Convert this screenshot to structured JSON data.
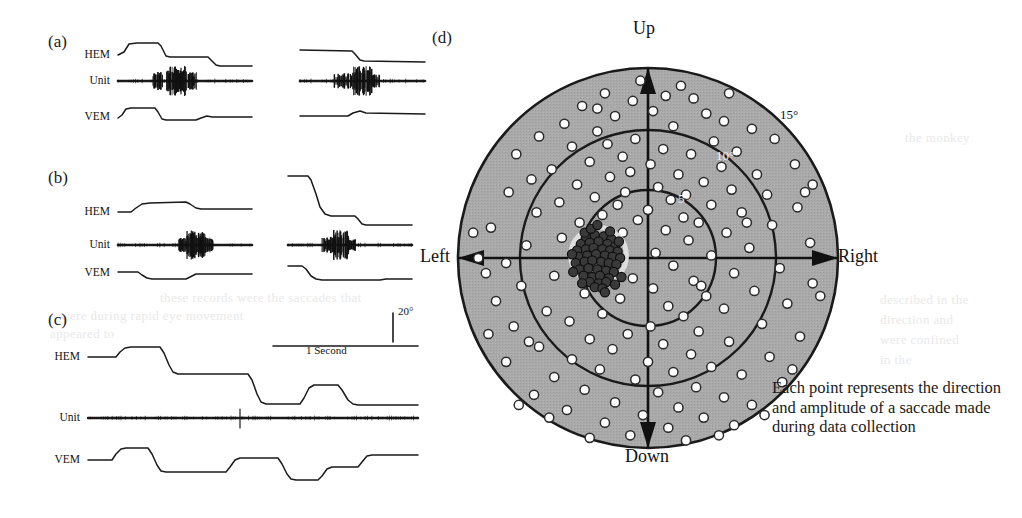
{
  "figure": {
    "panels": [
      {
        "id": "a",
        "letter": "(a)"
      },
      {
        "id": "b",
        "letter": "(b)"
      },
      {
        "id": "c",
        "letter": "(c)"
      },
      {
        "id": "d",
        "letter": "(d)"
      }
    ],
    "trace_labels": [
      "HEM",
      "Unit",
      "VEM"
    ],
    "scalebars": {
      "amplitude": "20°",
      "time": "1 Second"
    },
    "caption": "Each point represents the direction and amplitude of a saccade made during data collection",
    "axes": {
      "up": "Up",
      "down": "Down",
      "left": "Left",
      "right": "Right"
    },
    "rings": [
      {
        "label": "15°",
        "deg": 15,
        "style": "outer"
      },
      {
        "label": "10°",
        "deg": 10,
        "style": "inner"
      },
      {
        "label": "5°",
        "deg": 5,
        "style": "inner"
      }
    ],
    "colors": {
      "disk_fill": "#a9a9a9",
      "stroke": "#1a1a1a",
      "open_point_fill": "#ffffff",
      "dense_point_fill": "#3a3a3a",
      "cluster_ring": "#dedede",
      "page": "#ffffff"
    }
  },
  "chart_data": {
    "type": "scatter",
    "coordinate_system": "polar-cartesian (degrees of visual angle)",
    "title": "",
    "xlabel": "Horizontal eye position (deg)",
    "ylabel": "Vertical eye position (deg)",
    "xlim": [
      -15,
      15
    ],
    "ylim": [
      -15,
      15
    ],
    "grid": "concentric circles at 5, 10 and 15 degrees",
    "legend": "none",
    "ring_radii_deg": [
      5,
      10,
      15
    ],
    "series": [
      {
        "name": "saccades-open",
        "marker": "open circle",
        "points": [
          [
            -0.6,
            14.0
          ],
          [
            2.6,
            13.6
          ],
          [
            -3.4,
            13.0
          ],
          [
            1.4,
            12.8
          ],
          [
            -1.2,
            12.4
          ],
          [
            3.6,
            12.6
          ],
          [
            -5.2,
            12.0
          ],
          [
            0.4,
            11.6
          ],
          [
            4.6,
            11.4
          ],
          [
            -2.6,
            11.2
          ],
          [
            6.0,
            10.8
          ],
          [
            -6.6,
            10.6
          ],
          [
            2.0,
            10.4
          ],
          [
            -4.0,
            10.0
          ],
          [
            8.2,
            10.2
          ],
          [
            -8.6,
            9.6
          ],
          [
            -1.0,
            9.4
          ],
          [
            5.2,
            9.2
          ],
          [
            -3.2,
            9.0
          ],
          [
            10.0,
            9.4
          ],
          [
            -6.0,
            8.8
          ],
          [
            1.2,
            8.6
          ],
          [
            7.0,
            8.4
          ],
          [
            -10.4,
            8.2
          ],
          [
            -2.0,
            8.0
          ],
          [
            3.4,
            8.2
          ],
          [
            -4.6,
            7.6
          ],
          [
            11.6,
            7.4
          ],
          [
            0.2,
            7.4
          ],
          [
            5.8,
            7.2
          ],
          [
            -7.6,
            7.0
          ],
          [
            -1.4,
            6.8
          ],
          [
            8.6,
            6.6
          ],
          [
            2.4,
            6.6
          ],
          [
            -3.0,
            6.4
          ],
          [
            -9.2,
            6.2
          ],
          [
            4.4,
            6.0
          ],
          [
            13.0,
            5.8
          ],
          [
            -5.6,
            5.8
          ],
          [
            0.8,
            5.6
          ],
          [
            6.6,
            5.4
          ],
          [
            -1.8,
            5.2
          ],
          [
            -11.0,
            5.2
          ],
          [
            3.0,
            5.0
          ],
          [
            9.4,
            5.0
          ],
          [
            -4.2,
            4.8
          ],
          [
            1.8,
            4.6
          ],
          [
            -7.0,
            4.4
          ],
          [
            5.0,
            4.2
          ],
          [
            -2.4,
            4.2
          ],
          [
            11.8,
            4.0
          ],
          [
            0.0,
            3.8
          ],
          [
            7.4,
            3.6
          ],
          [
            -8.8,
            3.6
          ],
          [
            -3.6,
            3.4
          ],
          [
            2.8,
            3.2
          ],
          [
            -0.8,
            3.0
          ],
          [
            4.0,
            2.8
          ],
          [
            -5.4,
            2.8
          ],
          [
            9.8,
            2.6
          ],
          [
            -12.4,
            2.4
          ],
          [
            1.4,
            2.2
          ],
          [
            6.2,
            2.0
          ],
          [
            -2.0,
            2.0
          ],
          [
            -6.8,
            1.6
          ],
          [
            3.2,
            1.4
          ],
          [
            12.8,
            1.2
          ],
          [
            -9.6,
            1.0
          ],
          [
            8.0,
            0.8
          ],
          [
            -3.0,
            0.6
          ],
          [
            0.6,
            0.4
          ],
          [
            5.0,
            0.2
          ],
          [
            -13.4,
            0.0
          ],
          [
            -11.2,
            -0.4
          ],
          [
            2.0,
            -0.6
          ],
          [
            10.4,
            -0.8
          ],
          [
            -4.4,
            -1.0
          ],
          [
            6.8,
            -1.2
          ],
          [
            -7.4,
            -1.4
          ],
          [
            -1.2,
            -1.6
          ],
          [
            3.6,
            -1.8
          ],
          [
            13.0,
            -2.0
          ],
          [
            -10.0,
            -2.2
          ],
          [
            0.4,
            -2.4
          ],
          [
            8.4,
            -2.6
          ],
          [
            -5.0,
            -2.8
          ],
          [
            4.6,
            -3.0
          ],
          [
            -2.2,
            -3.2
          ],
          [
            -12.0,
            -3.4
          ],
          [
            11.0,
            -3.6
          ],
          [
            1.6,
            -3.8
          ],
          [
            6.0,
            -4.0
          ],
          [
            -8.0,
            -4.2
          ],
          [
            -3.6,
            -4.4
          ],
          [
            2.8,
            -4.6
          ],
          [
            -6.2,
            -5.0
          ],
          [
            9.0,
            -5.2
          ],
          [
            0.2,
            -5.4
          ],
          [
            -10.6,
            -5.4
          ],
          [
            4.0,
            -5.8
          ],
          [
            -1.6,
            -6.0
          ],
          [
            12.0,
            -6.2
          ],
          [
            -4.6,
            -6.4
          ],
          [
            6.4,
            -6.6
          ],
          [
            1.2,
            -6.8
          ],
          [
            -8.6,
            -7.0
          ],
          [
            -2.8,
            -7.2
          ],
          [
            3.4,
            -7.6
          ],
          [
            9.6,
            -7.8
          ],
          [
            -6.0,
            -8.0
          ],
          [
            0.0,
            -8.2
          ],
          [
            -11.2,
            -8.2
          ],
          [
            5.0,
            -8.6
          ],
          [
            -3.8,
            -8.8
          ],
          [
            2.0,
            -9.0
          ],
          [
            7.4,
            -9.2
          ],
          [
            -7.4,
            -9.4
          ],
          [
            -1.0,
            -9.6
          ],
          [
            10.6,
            -9.8
          ],
          [
            3.8,
            -10.2
          ],
          [
            -5.0,
            -10.4
          ],
          [
            0.8,
            -10.6
          ],
          [
            -9.0,
            -10.8
          ],
          [
            6.0,
            -11.0
          ],
          [
            -2.6,
            -11.4
          ],
          [
            2.4,
            -11.8
          ],
          [
            8.2,
            -11.6
          ],
          [
            -6.4,
            -12.0
          ],
          [
            -0.4,
            -12.4
          ],
          [
            4.4,
            -12.6
          ],
          [
            -3.4,
            -13.0
          ],
          [
            1.6,
            -13.4
          ],
          [
            6.8,
            -13.2
          ],
          [
            -1.4,
            -14.0
          ],
          [
            -4.6,
            -14.2
          ],
          [
            3.0,
            -14.4
          ],
          [
            -7.8,
            -12.6
          ],
          [
            11.4,
            -8.8
          ],
          [
            -12.6,
            -6.0
          ],
          [
            13.6,
            -3.0
          ],
          [
            -13.8,
            2.0
          ],
          [
            12.4,
            5.2
          ],
          [
            -12.8,
            -1.2
          ],
          [
            9.2,
            -12.4
          ],
          [
            -10.2,
            -11.6
          ],
          [
            5.6,
            -14.0
          ],
          [
            -5.8,
            0.4
          ],
          [
            7.8,
            2.8
          ],
          [
            -9.4,
            -6.6
          ],
          [
            4.2,
            -2.2
          ],
          [
            -4.0,
            11.8
          ],
          [
            6.4,
            13.0
          ]
        ]
      },
      {
        "name": "saccades-dense-cluster",
        "marker": "filled circle",
        "note": "tight cluster of near-identical small leftward saccades near centre, encircled",
        "cluster_centre_deg": [
          -3.9,
          0.2
        ],
        "cluster_radius_deg": 2.2,
        "points": [
          [
            -4.9,
            1.6
          ],
          [
            -4.2,
            1.8
          ],
          [
            -3.5,
            1.7
          ],
          [
            -2.9,
            1.5
          ],
          [
            -5.3,
            1.1
          ],
          [
            -4.6,
            1.2
          ],
          [
            -3.9,
            1.3
          ],
          [
            -3.2,
            1.1
          ],
          [
            -2.6,
            0.9
          ],
          [
            -5.6,
            0.6
          ],
          [
            -4.9,
            0.7
          ],
          [
            -4.3,
            0.8
          ],
          [
            -3.6,
            0.7
          ],
          [
            -3.0,
            0.6
          ],
          [
            -2.4,
            0.5
          ],
          [
            -5.5,
            0.1
          ],
          [
            -4.8,
            0.2
          ],
          [
            -4.1,
            0.3
          ],
          [
            -3.4,
            0.2
          ],
          [
            -2.8,
            0.1
          ],
          [
            -2.2,
            0.0
          ],
          [
            -5.7,
            -0.4
          ],
          [
            -5.0,
            -0.3
          ],
          [
            -4.4,
            -0.2
          ],
          [
            -3.7,
            -0.3
          ],
          [
            -3.1,
            -0.4
          ],
          [
            -2.5,
            -0.5
          ],
          [
            -5.4,
            -0.9
          ],
          [
            -4.7,
            -0.8
          ],
          [
            -4.0,
            -0.9
          ],
          [
            -3.3,
            -1.0
          ],
          [
            -2.7,
            -1.1
          ],
          [
            -5.1,
            -1.4
          ],
          [
            -4.4,
            -1.5
          ],
          [
            -3.8,
            -1.4
          ],
          [
            -3.1,
            -1.6
          ],
          [
            -4.6,
            -1.9
          ],
          [
            -3.9,
            -2.0
          ],
          [
            -3.3,
            -1.9
          ],
          [
            -4.2,
            -2.3
          ],
          [
            -3.6,
            -2.4
          ],
          [
            -5.0,
            2.0
          ],
          [
            -3.0,
            2.1
          ],
          [
            -2.3,
            1.3
          ],
          [
            -5.9,
            -1.1
          ],
          [
            -2.1,
            -1.5
          ],
          [
            -4.5,
            2.3
          ],
          [
            -3.4,
            -2.7
          ],
          [
            -5.2,
            -2.0
          ],
          [
            -2.6,
            -2.1
          ],
          [
            -6.0,
            0.3
          ],
          [
            -4.0,
            2.6
          ]
        ]
      }
    ]
  },
  "bleed_text": [
    {
      "t": "these records were the saccades that",
      "x": 160,
      "y": 290
    },
    {
      "t": "were during rapid eye movement",
      "x": 60,
      "y": 308
    },
    {
      "t": "appeared to",
      "x": 50,
      "y": 326
    },
    {
      "t": "the monkey",
      "x": 905,
      "y": 130
    },
    {
      "t": "described in the",
      "x": 880,
      "y": 292
    },
    {
      "t": "direction and",
      "x": 880,
      "y": 312
    },
    {
      "t": "were confined",
      "x": 880,
      "y": 332
    },
    {
      "t": "in the",
      "x": 880,
      "y": 352
    }
  ]
}
